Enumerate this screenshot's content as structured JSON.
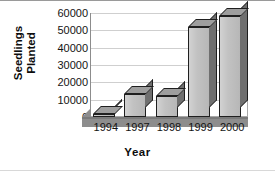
{
  "chart_data": {
    "type": "bar",
    "title": "",
    "xlabel": "Year",
    "ylabel": "Seedlings Planted",
    "categories": [
      "1994",
      "1997",
      "1998",
      "1999",
      "2000"
    ],
    "values": [
      1800,
      13000,
      12000,
      52000,
      58500
    ],
    "series": [
      {
        "name": "Seedlings Planted",
        "values": [
          1800,
          13000,
          12000,
          52000,
          58500
        ]
      }
    ],
    "ylim": [
      0,
      60000
    ],
    "ytick_labels": [
      "0",
      "10000",
      "20000",
      "30000",
      "40000",
      "50000",
      "60000"
    ],
    "ytick_values": [
      0,
      10000,
      20000,
      30000,
      40000,
      50000,
      60000
    ],
    "grid": true,
    "legend": false,
    "legend_position": "none",
    "style": "3d-column",
    "colors": {
      "bar_front": "#c2c2c2",
      "bar_side": "#6f6f6f",
      "bar_top": "#9e9e9e",
      "bar_outline": "#1f1f1f",
      "floor": "#8d8d8d",
      "plot_background": "#ffffff",
      "gridline": "#cfcfcf",
      "axis": "#8c8c8c",
      "text": "#141414"
    }
  },
  "axis": {
    "ylabel_line1": "Seedlings",
    "ylabel_line2": "Planted",
    "xlabel": "Year"
  }
}
